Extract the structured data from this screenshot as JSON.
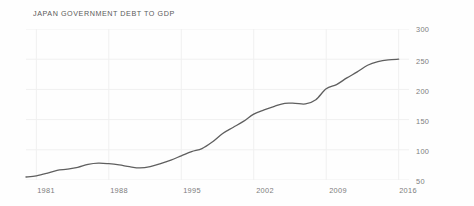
{
  "chart": {
    "title": "JAPAN GOVERNMENT DEBT TO GDP",
    "line_color": "#5f5f5f",
    "grid_color": "#f0f0f0",
    "label_color": "#7d7d7d",
    "background": "#fefefe"
  },
  "chart_data": {
    "type": "line",
    "title": "JAPAN GOVERNMENT DEBT TO GDP",
    "xlabel": "",
    "ylabel": "",
    "xlim": [
      1980,
      2017
    ],
    "ylim": [
      50,
      300
    ],
    "grid": true,
    "legend": null,
    "y_ticks": [
      300,
      250,
      200,
      150,
      100,
      50
    ],
    "x_ticks": [
      1981,
      1988,
      1995,
      2002,
      2009,
      2016
    ],
    "x": [
      1980,
      1981,
      1982,
      1983,
      1984,
      1985,
      1986,
      1987,
      1988,
      1989,
      1990,
      1991,
      1992,
      1993,
      1994,
      1995,
      1996,
      1997,
      1998,
      1999,
      2000,
      2001,
      2002,
      2003,
      2004,
      2005,
      2006,
      2007,
      2008,
      2009,
      2010,
      2011,
      2012,
      2013,
      2014,
      2015,
      2016
    ],
    "values": [
      55,
      57,
      61,
      66,
      68,
      71,
      76,
      78,
      77,
      75,
      72,
      70,
      72,
      77,
      83,
      90,
      97,
      102,
      113,
      127,
      137,
      147,
      159,
      166,
      172,
      177,
      177,
      176,
      183,
      201,
      208,
      219,
      229,
      240,
      246,
      249,
      250
    ],
    "series": [
      {
        "name": "Japan Government Debt to GDP",
        "values": [
          55,
          57,
          61,
          66,
          68,
          71,
          76,
          78,
          77,
          75,
          72,
          70,
          72,
          77,
          83,
          90,
          97,
          102,
          113,
          127,
          137,
          147,
          159,
          166,
          172,
          177,
          177,
          176,
          183,
          201,
          208,
          219,
          229,
          240,
          246,
          249,
          250
        ]
      }
    ]
  },
  "y_axis": {
    "ticks": [
      {
        "label": "300",
        "top": 25
      },
      {
        "label": "250",
        "top": 57
      },
      {
        "label": "200",
        "top": 87
      },
      {
        "label": "150",
        "top": 117
      },
      {
        "label": "100",
        "top": 147
      },
      {
        "label": "50",
        "top": 177
      }
    ]
  },
  "x_axis": {
    "ticks": [
      {
        "label": "1981",
        "left": 46,
        "top": 186
      },
      {
        "label": "1988",
        "left": 119,
        "top": 186
      },
      {
        "label": "1995",
        "left": 192,
        "top": 186
      },
      {
        "label": "2002",
        "left": 265,
        "top": 186
      },
      {
        "label": "2009",
        "left": 338,
        "top": 186
      },
      {
        "label": "2016",
        "left": 408,
        "top": 186
      }
    ]
  }
}
